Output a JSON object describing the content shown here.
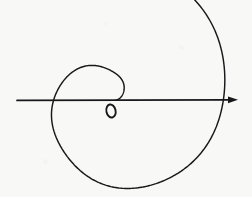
{
  "figure": {
    "kind": "hand-drawn-math-diagram",
    "width": 252,
    "height": 197,
    "background_color": "#f8f8f6",
    "ink_color": "#18181a"
  },
  "labels": {
    "origin": "o"
  },
  "chart_data": {
    "type": "line",
    "xlabel": "",
    "ylabel": "",
    "grid": false,
    "legend": null,
    "coordinate_system": "polar",
    "center": {
      "x": 112,
      "y": 100
    },
    "spiral": {
      "equation": "r = a + b*theta",
      "a": 3,
      "b": 17.5,
      "theta_start_deg": 0,
      "theta_end_deg": 630,
      "direction": "counterclockwise-outward",
      "inner_end": {
        "x": 120,
        "y": 97
      },
      "outer_end": {
        "x": 162,
        "y": 4
      },
      "axis_crossings_right": [
        120,
        167,
        214
      ],
      "axis_crossings_left": [
        88,
        45
      ],
      "extent_left": 41,
      "extent_right": 216,
      "extent_top": 34,
      "extent_bottom": 181
    },
    "axis": {
      "orientation": "horizontal",
      "y": 100,
      "x_start": 17,
      "x_end": 238,
      "arrow_at": "end",
      "arrow_tip": {
        "x": 238,
        "y": 100
      }
    },
    "annotations": [
      {
        "text": "o",
        "x": 111,
        "y": 111,
        "role": "origin-label"
      }
    ]
  }
}
